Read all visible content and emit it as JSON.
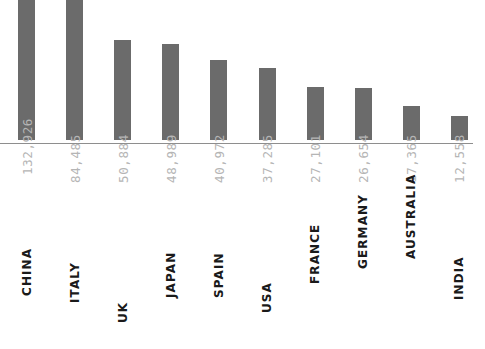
{
  "chart_data": {
    "type": "bar",
    "title": "",
    "subtitle": "",
    "xlabel": "",
    "ylabel": "",
    "orientation": "vertical",
    "grid": false,
    "legend": null,
    "axis_visible": {
      "baseline": true,
      "y_axis": false,
      "y_ticks": false
    },
    "note": "Tallest two bars (CHINA, ITALY) are clipped by the top edge of the image",
    "categories": [
      "CHINA",
      "ITALY",
      "UK",
      "JAPAN",
      "SPAIN",
      "USA",
      "FRANCE",
      "GERMANY",
      "AUSTRALIA",
      "INDIA"
    ],
    "values": [
      132926,
      84485,
      50884,
      48989,
      40972,
      37285,
      27101,
      26654,
      17365,
      12558
    ],
    "value_labels": [
      "132,926",
      "84,485",
      "50,884",
      "48,989",
      "40,972",
      "37,285",
      "27,101",
      "26,654",
      "17,365",
      "12,558"
    ],
    "ylim": [
      0,
      132926
    ],
    "bars": [
      {
        "category": "CHINA",
        "value": 132926,
        "value_label": "132,926",
        "pixel_height": 262,
        "clipped": true
      },
      {
        "category": "ITALY",
        "value": 84485,
        "value_label": "84,485",
        "pixel_height": 166,
        "clipped": true
      },
      {
        "category": "UK",
        "value": 50884,
        "value_label": "50,884",
        "pixel_height": 100,
        "clipped": false
      },
      {
        "category": "JAPAN",
        "value": 48989,
        "value_label": "48,989",
        "pixel_height": 96,
        "clipped": false
      },
      {
        "category": "SPAIN",
        "value": 40972,
        "value_label": "40,972",
        "pixel_height": 80,
        "clipped": false
      },
      {
        "category": "USA",
        "value": 37285,
        "value_label": "37,285",
        "pixel_height": 72,
        "clipped": false
      },
      {
        "category": "FRANCE",
        "value": 27101,
        "value_label": "27,101",
        "pixel_height": 53,
        "clipped": false
      },
      {
        "category": "GERMANY",
        "value": 26654,
        "value_label": "26,654",
        "pixel_height": 52,
        "clipped": false
      },
      {
        "category": "AUSTRALIA",
        "value": 17365,
        "value_label": "17,365",
        "pixel_height": 34,
        "clipped": false
      },
      {
        "category": "INDIA",
        "value": 12558,
        "value_label": "12,558",
        "pixel_height": 24,
        "clipped": false
      }
    ]
  },
  "style": {
    "bar_color": "#6b6b6b",
    "value_label_color": "#b5b5b5",
    "category_label_color": "#1a1a1a",
    "axis_line_color": "#8e8e8e",
    "background_color": "#ffffff"
  }
}
